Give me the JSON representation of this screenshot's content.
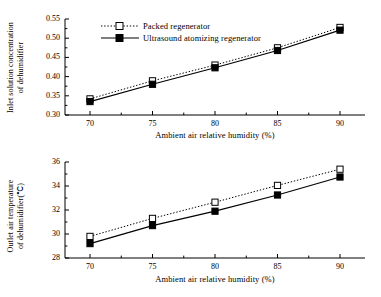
{
  "figure": {
    "background": "#ffffff",
    "line_color": "#000000",
    "width": 381,
    "height": 297
  },
  "legend": {
    "position": "top-left-inside",
    "entries": [
      {
        "label": "Packed regenerator",
        "marker": "open-square",
        "line": "dotted"
      },
      {
        "label": "Ultrasound atomizing regenerator",
        "marker": "filled-square",
        "line": "solid"
      }
    ]
  },
  "chart_data": [
    {
      "type": "line",
      "id": "inlet-solution-concentration",
      "title": "",
      "xlabel": "Ambient air relative humidity (%)",
      "ylabel": "Inlet solution concentration of dehumidifier",
      "ylabel_lines": [
        "Inlet solution concentration",
        "of dehumidifier"
      ],
      "x": [
        70,
        75,
        80,
        85,
        90
      ],
      "xticks": [
        "70",
        "75",
        "80",
        "85",
        "90"
      ],
      "yticks": [
        "0.30",
        "0.35",
        "0.40",
        "0.45",
        "0.50",
        "0.55"
      ],
      "xlim": [
        68,
        92
      ],
      "ylim": [
        0.3,
        0.55
      ],
      "grid": false,
      "minor_ticks": true,
      "series": [
        {
          "name": "Packed regenerator",
          "values": [
            0.342,
            0.389,
            0.43,
            0.475,
            0.528
          ],
          "marker": "open-square",
          "line": "dotted"
        },
        {
          "name": "Ultrasound atomizing regenerator",
          "values": [
            0.335,
            0.38,
            0.423,
            0.468,
            0.521
          ],
          "marker": "filled-square",
          "line": "solid"
        }
      ]
    },
    {
      "type": "line",
      "id": "outlet-air-temperature",
      "title": "",
      "xlabel": "Ambient air relative humidity (%)",
      "ylabel": "Outlet air temperature of dehumidifier(℃)",
      "ylabel_lines": [
        "Outlet air temperature",
        "of dehumidifier(℃)"
      ],
      "x": [
        70,
        75,
        80,
        85,
        90
      ],
      "xticks": [
        "70",
        "75",
        "80",
        "85",
        "90"
      ],
      "yticks": [
        "28",
        "30",
        "32",
        "34",
        "36"
      ],
      "xlim": [
        68,
        92
      ],
      "ylim": [
        28,
        36
      ],
      "grid": false,
      "minor_ticks": true,
      "series": [
        {
          "name": "Packed regenerator",
          "values": [
            29.8,
            31.3,
            32.65,
            34.05,
            35.4
          ],
          "marker": "open-square",
          "line": "dotted"
        },
        {
          "name": "Ultrasound atomizing regenerator",
          "values": [
            29.2,
            30.7,
            31.9,
            33.25,
            34.75
          ],
          "marker": "filled-square",
          "line": "solid"
        }
      ]
    }
  ]
}
